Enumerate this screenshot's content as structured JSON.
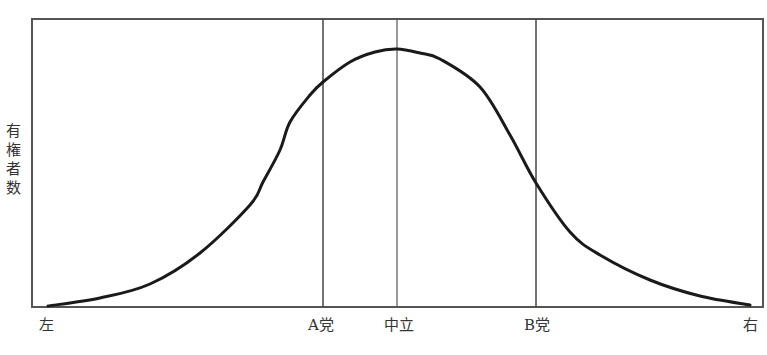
{
  "chart_data": {
    "type": "line",
    "title": "",
    "ylabel": "有権者数",
    "xlabel": "",
    "grid": false,
    "x_tick_labels": [
      "左",
      "A党",
      "中立",
      "B党",
      "右"
    ],
    "x_tick_positions_px": [
      48,
      323,
      397,
      536,
      750
    ],
    "vertical_markers": [
      {
        "label": "A党",
        "x_px": 323
      },
      {
        "label": "中立",
        "x_px": 397
      },
      {
        "label": "B党",
        "x_px": 536
      }
    ],
    "series": [
      {
        "name": "有権者分布",
        "shape": "bell curve (single-peaked, peak at 中立)",
        "points_px": [
          [
            48,
            306
          ],
          [
            100,
            298
          ],
          [
            150,
            284
          ],
          [
            200,
            253
          ],
          [
            250,
            205
          ],
          [
            263,
            182
          ],
          [
            280,
            150
          ],
          [
            290,
            122
          ],
          [
            310,
            95
          ],
          [
            323,
            82
          ],
          [
            350,
            62
          ],
          [
            375,
            52
          ],
          [
            397,
            49
          ],
          [
            420,
            53
          ],
          [
            440,
            59
          ],
          [
            480,
            87
          ],
          [
            510,
            135
          ],
          [
            536,
            183
          ],
          [
            570,
            232
          ],
          [
            600,
            255
          ],
          [
            650,
            280
          ],
          [
            700,
            296
          ],
          [
            750,
            305
          ]
        ]
      }
    ],
    "plot_area_px": {
      "left": 32,
      "top": 19,
      "right": 763,
      "bottom": 307
    }
  },
  "labels": {
    "y_axis": [
      "有",
      "権",
      "者",
      "数"
    ],
    "x_left": "左",
    "x_a": "A党",
    "x_center": "中立",
    "x_b": "B党",
    "x_right": "右"
  }
}
